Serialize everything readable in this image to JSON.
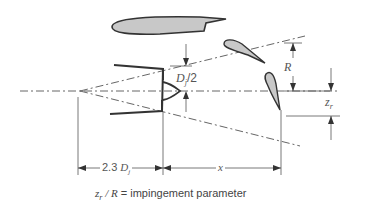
{
  "diagram": {
    "type": "jet impingement schematic",
    "colors": {
      "line": "#333333",
      "centerline": "#666666",
      "airfoil_fill": "#c8c8c8",
      "airfoil_stroke": "#333333",
      "text": "#555555"
    },
    "labels": {
      "half_diameter": "D",
      "half_diameter_sub": "j",
      "half_diameter_suffix": "/2",
      "radius": "R",
      "offset": "z",
      "offset_sub": "r",
      "virtual_origin_distance_prefix": "2.3 ",
      "virtual_origin_distance_var": "D",
      "virtual_origin_distance_sub": "j",
      "axial_distance": "x"
    },
    "caption": {
      "var": "z",
      "var_sub": "r",
      "separator": " / ",
      "denominator": "R",
      "equals": " = ",
      "text": "impingement parameter"
    },
    "elements": [
      "nozzle",
      "plug",
      "jet-centerline",
      "jet-spread-lines",
      "wing-airfoil",
      "flap-airfoil-upper",
      "flap-airfoil-lower"
    ]
  }
}
